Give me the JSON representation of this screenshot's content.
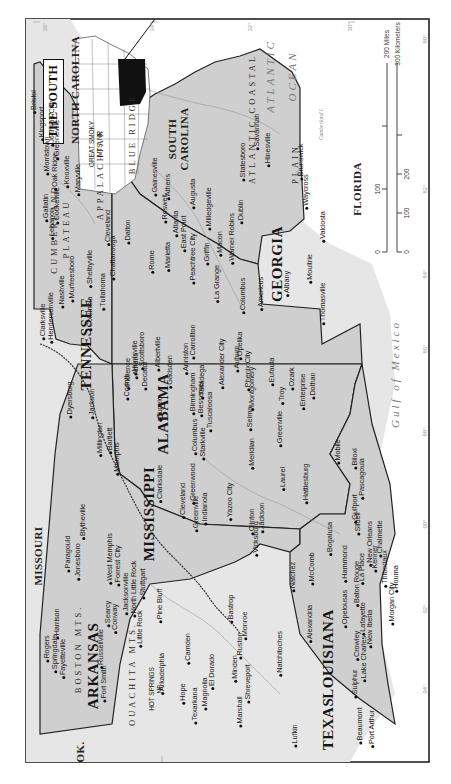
{
  "map": {
    "title": "THE SOUTH",
    "orientation_note_visible": false,
    "colors": {
      "land_focus": "#c9c9c9",
      "land_other": "#e4e4e4",
      "water": "#ffffff",
      "border": "#222222",
      "inset_highlight": "#111111"
    },
    "states": [
      {
        "name": "TENNESSEE",
        "focus": true
      },
      {
        "name": "GEORGIA",
        "focus": true
      },
      {
        "name": "ALABAMA",
        "focus": true
      },
      {
        "name": "MISSISSIPPI",
        "focus": true
      },
      {
        "name": "ARKANSAS",
        "focus": true
      },
      {
        "name": "LOUISIANA",
        "focus": true
      },
      {
        "name": "NORTH CAROLINA",
        "focus": false
      },
      {
        "name": "SOUTH CAROLINA",
        "focus": false
      },
      {
        "name": "FLORIDA",
        "focus": false
      },
      {
        "name": "MISSOURI",
        "focus": false
      },
      {
        "name": "OK.",
        "focus": false
      },
      {
        "name": "TEXAS",
        "focus": false
      }
    ],
    "water_bodies": [
      "ATLANTIC",
      "OCEAN",
      "Gulf of Mexico"
    ],
    "regions": [
      "CUMBERLAND PLATEAU",
      "APPALACHIAN",
      "BLUE RIDGE",
      "ATLANTIC COASTAL PLAIN",
      "BOSTON MTS.",
      "OUACHITA MTS."
    ],
    "parks": [
      "GREAT SMOKY MTS. NP",
      "HOT SPRINGS NP"
    ],
    "islands": [
      "Cumberland I."
    ],
    "rivers": [
      "Savannah River",
      "Ogeechee River",
      "Tennessee River",
      "Tombigbee River",
      "Alabama River",
      "Pearl River",
      "Red River",
      "Ouachita River",
      "White River",
      "Arkansas River",
      "Mississippi River",
      "Yazoo River",
      "Sabine River"
    ],
    "lakes": [
      "Hartwell Lake",
      "Clark Hill L.",
      "Lake Sidney Lanier",
      "Kentucky Lake",
      "Lake Pontchartrain",
      "Toledo Bend Res.",
      "Chickamauga L.",
      "Douglas Lake"
    ],
    "cities": {
      "tennessee": [
        "Bristol",
        "Kingsport",
        "Johnson City",
        "Greeneville",
        "Morristown",
        "Oak Ridge",
        "Knoxville",
        "Maryville",
        "Cleveland",
        "Chattanooga",
        "Cookeville",
        "Gallatin",
        "Lebanon",
        "Clarksville",
        "Hendersonville",
        "Nashville",
        "Murfreesboro",
        "Shelbyville",
        "Tullahoma",
        "Columbia",
        "Dyersburg",
        "Jackson",
        "Millington",
        "Bartlett",
        "Memphis"
      ],
      "georgia": [
        "Augusta",
        "Statesboro",
        "Savannah",
        "Hinesville",
        "Brunswick",
        "Waycross",
        "Valdosta",
        "Milledgeville",
        "Dublin",
        "Warner Robins",
        "Macon",
        "Athens",
        "Gainesville",
        "Roswell",
        "Atlanta",
        "East Point",
        "Peachtree City",
        "Griffin",
        "Marietta",
        "Dalton",
        "Rome",
        "La Grange",
        "Columbus",
        "Americus",
        "Albany",
        "Moultrie",
        "Thomasville"
      ],
      "alabama": [
        "Huntsville",
        "Scottsboro",
        "Albertville",
        "Gadsden",
        "Anniston",
        "Carrollton",
        "Talladega",
        "Alexander City",
        "Auburn",
        "Opelika",
        "Phenix City",
        "Montgomery",
        "Eufaula",
        "Troy",
        "Ozark",
        "Enterprise",
        "Dothan",
        "Florence",
        "Athens",
        "Decatur",
        "Birmingham",
        "Bessemer",
        "Tuscaloosa",
        "Selma",
        "Greenville",
        "Mobile"
      ],
      "mississippi": [
        "Corinth",
        "Tupelo",
        "Columbus",
        "Starkville",
        "Clarksdale",
        "Cleveland",
        "Greenwood",
        "Greenville",
        "Indianola",
        "Yazoo City",
        "Clinton",
        "Vicksburg",
        "Jackson",
        "Meridian",
        "Laurel",
        "Hattiesburg",
        "Natchez",
        "McComb",
        "Gulfport",
        "Biloxi",
        "Pascagoula"
      ],
      "arkansas": [
        "Paragould",
        "Jonesboro",
        "Blytheville",
        "West Memphis",
        "Forrest City",
        "Jacksonville",
        "North Little Rock",
        "Stuttgart",
        "Pine Bluff",
        "Searcy",
        "Conway",
        "Little Rock",
        "Russellville",
        "Harrison",
        "Rogers",
        "Springdale",
        "Fayetteville",
        "Fort Smith",
        "Arkadelphia",
        "Camden",
        "El Dorado",
        "Hope",
        "Texarkana",
        "Magnolia"
      ],
      "louisiana": [
        "Bastrop",
        "Monroe",
        "Ruston",
        "Minden",
        "Shreveport",
        "Natchitoches",
        "Alexandria",
        "Opelousas",
        "Baton Rouge",
        "Hammond",
        "Bogalusa",
        "Slidell",
        "New Orleans",
        "Chalmette",
        "La Place",
        "Kenner",
        "Thibodaux",
        "Houma",
        "Lafayette",
        "New Iberia",
        "Morgan City",
        "Crowley",
        "Lake Charles",
        "Sulphur"
      ],
      "other": [
        "Marshall",
        "Lufkin",
        "Beaumont",
        "Port Arthur"
      ]
    },
    "scale_bar": {
      "miles_labels": [
        "0",
        "100",
        "200 Miles"
      ],
      "km_labels": [
        "0",
        "100",
        "200",
        "300 Kilometers"
      ]
    },
    "graticule": {
      "latitudes": [
        "36°",
        "34°",
        "32°",
        "30°"
      ],
      "longitudes": [
        "80°",
        "82°",
        "84°",
        "86°",
        "88°",
        "90°",
        "92°",
        "94°"
      ]
    }
  },
  "labels": [
    {
      "t": "THE SOUTH",
      "k": "title"
    },
    {
      "t": "NORTH CAROLINA",
      "k": "state-sm"
    },
    {
      "t": "SOUTH",
      "k": "state-sm"
    },
    {
      "t": "CAROLINA",
      "k": "state-sm"
    },
    {
      "t": "FLORIDA",
      "k": "state-sm"
    },
    {
      "t": "MISSOURI",
      "k": "state-sm"
    },
    {
      "t": "OK.",
      "k": "state-sm"
    },
    {
      "t": "TEXAS",
      "k": "state"
    },
    {
      "t": "TENNESSEE",
      "k": "state"
    },
    {
      "t": "GEORGIA",
      "k": "state"
    },
    {
      "t": "ALABAMA",
      "k": "state"
    },
    {
      "t": "MISSISSIPPI",
      "k": "state"
    },
    {
      "t": "ARKANSAS",
      "k": "state"
    },
    {
      "t": "LOUISIANA",
      "k": "state"
    },
    {
      "t": "ATLANTIC",
      "k": "water"
    },
    {
      "t": "OCEAN",
      "k": "water"
    },
    {
      "t": "Gulf of Mexico",
      "k": "water"
    },
    {
      "t": "CUMBERLAND",
      "k": "region"
    },
    {
      "t": "PLATEAU",
      "k": "region"
    },
    {
      "t": "APPALACHIAN",
      "k": "region"
    },
    {
      "t": "BLUE RIDGE",
      "k": "region"
    },
    {
      "t": "ATLANTIC COASTAL",
      "k": "region"
    },
    {
      "t": "PLAIN",
      "k": "region"
    },
    {
      "t": "BOSTON MTS.",
      "k": "region"
    },
    {
      "t": "OUACHITA MTS.",
      "k": "region"
    },
    {
      "t": "GREAT SMOKY",
      "k": "park"
    },
    {
      "t": "MTS. NP",
      "k": "park"
    },
    {
      "t": "HOT SPRINGS",
      "k": "park"
    },
    {
      "t": "NP",
      "k": "park"
    },
    {
      "t": "Cumberland I.",
      "k": "river"
    }
  ]
}
